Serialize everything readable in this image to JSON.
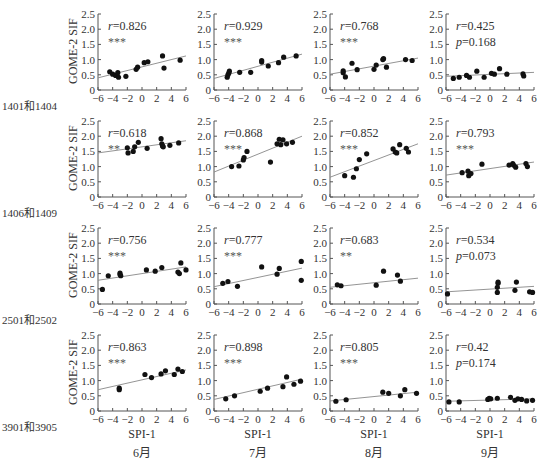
{
  "figure": {
    "y_axis_label": "GOME-2 SIF",
    "x_axis_label": "SPI-1",
    "rows": [
      "1401和1404",
      "1406和1409",
      "2501和2502",
      "3901和3905"
    ],
    "cols": [
      "6月",
      "7月",
      "8月",
      "9月"
    ]
  },
  "chart_data": {
    "type": "scatter",
    "layout": "4x4 grid of scatter plots with linear fit lines",
    "xlabel": "SPI-1",
    "ylabel": "GOME-2 SIF",
    "xlim": [
      -6,
      6
    ],
    "ylim": [
      0,
      2.5
    ],
    "xticks": [
      -6,
      -4,
      -2,
      0,
      2,
      4,
      6
    ],
    "yticks": [
      0,
      0.5,
      1.0,
      1.5,
      2.0,
      2.5
    ],
    "ytick_labels": [
      "0",
      "0.5",
      "1.0",
      "1.5",
      "2.0",
      "2.5"
    ],
    "grid": false,
    "panels": [
      {
        "row": "1401和1404",
        "month": "6月",
        "r": "r=0.826",
        "sig": "***",
        "fit": [
          [
            -6,
            0.4
          ],
          [
            6,
            1.12
          ]
        ],
        "points": [
          [
            -4.4,
            0.6
          ],
          [
            -4.0,
            0.52
          ],
          [
            -3.6,
            0.48
          ],
          [
            -3.3,
            0.57
          ],
          [
            -3.2,
            0.42
          ],
          [
            -2.2,
            0.45
          ],
          [
            -0.8,
            0.68
          ],
          [
            -0.6,
            0.75
          ],
          [
            0.3,
            0.9
          ],
          [
            0.8,
            0.93
          ],
          [
            2.8,
            1.12
          ],
          [
            3.0,
            0.72
          ],
          [
            5.2,
            0.98
          ]
        ]
      },
      {
        "row": "1401和1404",
        "month": "7月",
        "r": "r=0.929",
        "sig": "***",
        "fit": [
          [
            -6,
            0.38
          ],
          [
            6,
            1.18
          ]
        ],
        "points": [
          [
            -4.2,
            0.42
          ],
          [
            -4.1,
            0.5
          ],
          [
            -4.0,
            0.55
          ],
          [
            -3.9,
            0.62
          ],
          [
            -2.5,
            0.58
          ],
          [
            -1.0,
            0.58
          ],
          [
            0.5,
            0.92
          ],
          [
            0.5,
            0.97
          ],
          [
            1.4,
            0.79
          ],
          [
            2.8,
            0.9
          ],
          [
            3.5,
            1.08
          ],
          [
            5.2,
            1.12
          ]
        ]
      },
      {
        "row": "1401和1404",
        "month": "8月",
        "r": "r=0.768",
        "sig": "***",
        "fit": [
          [
            -6,
            0.52
          ],
          [
            6,
            1.05
          ]
        ],
        "points": [
          [
            -4.2,
            0.57
          ],
          [
            -4.2,
            0.63
          ],
          [
            -3.9,
            0.43
          ],
          [
            -3.0,
            0.88
          ],
          [
            -2.3,
            0.67
          ],
          [
            0.0,
            0.68
          ],
          [
            0.3,
            0.82
          ],
          [
            1.2,
            1.0
          ],
          [
            1.3,
            1.03
          ],
          [
            1.7,
            0.75
          ],
          [
            4.3,
            1.0
          ],
          [
            5.2,
            0.97
          ]
        ]
      },
      {
        "row": "1401和1404",
        "month": "9月",
        "r": "r=0.425",
        "p": "p=0.168",
        "fit": [
          [
            -6,
            0.45
          ],
          [
            6,
            0.58
          ]
        ],
        "points": [
          [
            -5.0,
            0.38
          ],
          [
            -4.2,
            0.42
          ],
          [
            -3.2,
            0.48
          ],
          [
            -2.8,
            0.42
          ],
          [
            -1.8,
            0.62
          ],
          [
            -0.8,
            0.42
          ],
          [
            0.2,
            0.55
          ],
          [
            0.6,
            0.52
          ],
          [
            1.3,
            0.7
          ],
          [
            2.3,
            0.52
          ],
          [
            4.5,
            0.53
          ],
          [
            4.6,
            0.46
          ]
        ]
      },
      {
        "row": "1406和1409",
        "month": "6月",
        "r": "r=0.618",
        "sig": "**",
        "fit": [
          [
            -6,
            1.45
          ],
          [
            6,
            1.85
          ]
        ],
        "points": [
          [
            -2.0,
            1.62
          ],
          [
            -1.9,
            1.45
          ],
          [
            -1.2,
            1.5
          ],
          [
            -1.0,
            1.65
          ],
          [
            -0.5,
            1.8
          ],
          [
            0.7,
            1.6
          ],
          [
            2.6,
            1.92
          ],
          [
            2.7,
            1.75
          ],
          [
            2.8,
            1.68
          ],
          [
            2.9,
            1.65
          ],
          [
            3.8,
            1.7
          ],
          [
            5.0,
            1.78
          ]
        ]
      },
      {
        "row": "1406和1409",
        "month": "7月",
        "r": "r=0.868",
        "sig": "***",
        "fit": [
          [
            -6,
            0.82
          ],
          [
            6,
            2.0
          ]
        ],
        "points": [
          [
            -3.6,
            1.0
          ],
          [
            -2.6,
            1.02
          ],
          [
            -2.0,
            1.22
          ],
          [
            -1.9,
            1.3
          ],
          [
            -1.5,
            1.5
          ],
          [
            1.7,
            1.15
          ],
          [
            2.6,
            1.75
          ],
          [
            2.9,
            1.9
          ],
          [
            3.1,
            1.72
          ],
          [
            3.4,
            1.88
          ],
          [
            3.9,
            1.75
          ],
          [
            4.7,
            1.8
          ]
        ]
      },
      {
        "row": "1406和1409",
        "month": "8月",
        "r": "r=0.852",
        "sig": "***",
        "fit": [
          [
            -6,
            0.65
          ],
          [
            6,
            1.75
          ]
        ],
        "points": [
          [
            -4.0,
            0.7
          ],
          [
            -2.8,
            0.65
          ],
          [
            -2.4,
            0.93
          ],
          [
            -2.0,
            1.23
          ],
          [
            -1.0,
            1.42
          ],
          [
            2.6,
            1.58
          ],
          [
            2.9,
            1.48
          ],
          [
            3.1,
            1.45
          ],
          [
            3.5,
            1.72
          ],
          [
            4.4,
            1.6
          ],
          [
            4.7,
            1.48
          ]
        ]
      },
      {
        "row": "1406和1409",
        "month": "9月",
        "r": "r=0.793",
        "sig": "***",
        "fit": [
          [
            -6,
            0.72
          ],
          [
            6,
            1.15
          ]
        ],
        "points": [
          [
            -3.8,
            0.8
          ],
          [
            -3.0,
            0.85
          ],
          [
            -2.9,
            0.7
          ],
          [
            -2.6,
            0.77
          ],
          [
            -1.1,
            1.08
          ],
          [
            2.6,
            1.05
          ],
          [
            3.1,
            1.1
          ],
          [
            3.2,
            1.05
          ],
          [
            3.5,
            0.98
          ],
          [
            4.9,
            1.1
          ],
          [
            5.1,
            1.0
          ]
        ]
      },
      {
        "row": "2501和2502",
        "month": "6月",
        "r": "r=0.756",
        "sig": "***",
        "fit": [
          [
            -6,
            0.78
          ],
          [
            6,
            1.22
          ]
        ],
        "points": [
          [
            -5.4,
            0.48
          ],
          [
            -4.6,
            0.93
          ],
          [
            -3.0,
            0.97
          ],
          [
            -3.0,
            1.02
          ],
          [
            -2.9,
            0.93
          ],
          [
            0.6,
            1.12
          ],
          [
            1.8,
            1.08
          ],
          [
            2.7,
            1.2
          ],
          [
            4.9,
            1.05
          ],
          [
            5.1,
            1.0
          ],
          [
            5.3,
            1.35
          ],
          [
            6.0,
            1.12
          ]
        ]
      },
      {
        "row": "2501和2502",
        "month": "7月",
        "r": "r=0.777",
        "sig": "***",
        "fit": [
          [
            -6,
            0.57
          ],
          [
            6,
            1.18
          ]
        ],
        "points": [
          [
            -4.8,
            0.68
          ],
          [
            -4.1,
            0.74
          ],
          [
            -2.8,
            0.58
          ],
          [
            0.5,
            1.22
          ],
          [
            2.6,
            0.98
          ],
          [
            2.9,
            1.17
          ],
          [
            5.9,
            1.4
          ],
          [
            5.9,
            0.78
          ]
        ]
      },
      {
        "row": "2501和2502",
        "month": "8月",
        "r": "r=0.683",
        "sig": "**",
        "fit": [
          [
            -6,
            0.55
          ],
          [
            6,
            0.85
          ]
        ],
        "points": [
          [
            -5.0,
            0.63
          ],
          [
            -4.5,
            0.6
          ],
          [
            0.3,
            0.62
          ],
          [
            1.3,
            1.08
          ],
          [
            3.2,
            0.95
          ],
          [
            3.6,
            0.75
          ]
        ]
      },
      {
        "row": "2501和2502",
        "month": "9月",
        "r": "r=0.534",
        "p": "p=0.073",
        "fit": [
          [
            -6,
            0.4
          ],
          [
            6,
            0.58
          ]
        ],
        "points": [
          [
            -5.8,
            0.33
          ],
          [
            1.0,
            0.38
          ],
          [
            1.0,
            0.55
          ],
          [
            1.1,
            0.68
          ],
          [
            1.1,
            0.72
          ],
          [
            3.4,
            0.45
          ],
          [
            3.6,
            0.72
          ],
          [
            5.4,
            0.4
          ],
          [
            5.8,
            0.38
          ]
        ]
      },
      {
        "row": "3901和3905",
        "month": "6月",
        "r": "r=0.863",
        "sig": "***",
        "fit": [
          [
            -6,
            0.7
          ],
          [
            6,
            1.35
          ]
        ],
        "points": [
          [
            -3.1,
            0.7
          ],
          [
            -3.1,
            0.75
          ],
          [
            0.4,
            1.2
          ],
          [
            1.3,
            1.1
          ],
          [
            2.6,
            1.22
          ],
          [
            3.2,
            1.32
          ],
          [
            4.4,
            1.2
          ],
          [
            4.9,
            1.38
          ],
          [
            5.5,
            1.3
          ]
        ]
      },
      {
        "row": "3901和3905",
        "month": "7月",
        "r": "r=0.898",
        "sig": "***",
        "fit": [
          [
            -6,
            0.38
          ],
          [
            6,
            1.05
          ]
        ],
        "points": [
          [
            -4.4,
            0.4
          ],
          [
            -3.2,
            0.5
          ],
          [
            0.3,
            0.65
          ],
          [
            1.3,
            0.75
          ],
          [
            3.4,
            0.8
          ],
          [
            3.9,
            1.12
          ],
          [
            4.9,
            0.88
          ],
          [
            5.8,
            0.98
          ]
        ]
      },
      {
        "row": "3901和3905",
        "month": "8月",
        "r": "r=0.805",
        "sig": "***",
        "fit": [
          [
            -6,
            0.33
          ],
          [
            6,
            0.62
          ]
        ],
        "points": [
          [
            -5.2,
            0.32
          ],
          [
            -3.8,
            0.37
          ],
          [
            1.2,
            0.62
          ],
          [
            2.0,
            0.58
          ],
          [
            3.6,
            0.5
          ],
          [
            4.2,
            0.7
          ],
          [
            5.8,
            0.58
          ]
        ]
      },
      {
        "row": "3901和3905",
        "month": "9月",
        "r": "r=0.42",
        "p": "p=0.174",
        "fit": [
          [
            -6,
            0.32
          ],
          [
            6,
            0.4
          ]
        ],
        "points": [
          [
            -5.6,
            0.3
          ],
          [
            -4.2,
            0.3
          ],
          [
            -0.3,
            0.38
          ],
          [
            -0.1,
            0.42
          ],
          [
            0.1,
            0.4
          ],
          [
            1.0,
            0.42
          ],
          [
            2.8,
            0.45
          ],
          [
            3.4,
            0.35
          ],
          [
            3.8,
            0.4
          ],
          [
            4.3,
            0.38
          ],
          [
            5.0,
            0.33
          ],
          [
            5.8,
            0.35
          ]
        ]
      }
    ]
  }
}
